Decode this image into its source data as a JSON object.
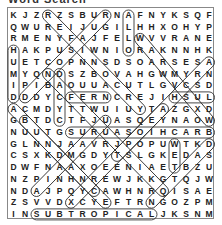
{
  "title": "Word Search",
  "grid": {
    "rows": 18,
    "cols": 18,
    "letters": [
      "KJZRZSBURNAFNYKSQF",
      "QWUREIJUGILHHXOHYP",
      "RMENYFAJFELWVVRANE",
      "HAKPUSIWNIORAKNNHK",
      "UETCOPNNSDSOARSESA",
      "MYQNDSZBOVAHGWMYRN",
      "IPIBAOUUACUTLGVCSD",
      "DDDYCFERNCREJIHSUL",
      "ACMDYTTWUIUYTAZGXD",
      "GBTDCTFJUASQEYNAOW",
      "NUUTGSURUASOIHCARB",
      "GLNNJAAVRJPOPUWTKD",
      "CSXKDMGDYTSLGKEDAS",
      "DWFNAAXOEENIAETBZU",
      "NZPINHNREWJKKGTQJW",
      "NDAJPQYCAWHNRQISAE",
      "ZSVVDXCYEFTRNGOZPM",
      "INSUBTROPICALJKSNM"
    ]
  },
  "found_words": [
    {
      "word": "HUMID",
      "r1": 3,
      "c1": 0,
      "r2": 7,
      "c2": 0
    },
    {
      "word": "FERN",
      "r1": 7,
      "c1": 5,
      "r2": 7,
      "c2": 8
    },
    {
      "word": "LUSH",
      "r1": 7,
      "c1": 17,
      "r2": 7,
      "c2": 14
    },
    {
      "word": "BRACHIOSAURUS",
      "r1": 10,
      "c1": 17,
      "r2": 10,
      "c2": 5
    },
    {
      "word": "SUBTROPICAL",
      "r1": 17,
      "c1": 2,
      "r2": 17,
      "c2": 12
    },
    {
      "word": "CYCAD",
      "r1": 9,
      "c1": 4,
      "r2": 5,
      "c2": 4
    },
    {
      "word": "WET",
      "r1": 11,
      "c1": 14,
      "r2": 13,
      "c2": 14
    },
    {
      "word": "ALLOSAURUS",
      "r1": 0,
      "c1": 10,
      "r2": 3,
      "c2": 10
    },
    {
      "word": "DIAG1",
      "r1": 0,
      "c1": 3,
      "r2": 8,
      "c2": 11
    },
    {
      "word": "DIAG2",
      "r1": 0,
      "c1": 8,
      "r2": 7,
      "c2": 1
    },
    {
      "word": "DIAG3",
      "r1": 2,
      "c1": 11,
      "r2": 9,
      "c2": 17
    },
    {
      "word": "DIAG4",
      "r1": 4,
      "c1": 17,
      "r2": 12,
      "c2": 9
    },
    {
      "word": "DIAG5",
      "r1": 8,
      "c1": 0,
      "r2": 16,
      "c2": 8
    },
    {
      "word": "DIAG6",
      "r1": 9,
      "c1": 1,
      "r2": 15,
      "c2": 7
    },
    {
      "word": "DIAG7",
      "r1": 5,
      "c1": 3,
      "r2": 15,
      "c2": 13
    },
    {
      "word": "DIAG8",
      "r1": 15,
      "c1": 2,
      "r2": 9,
      "c2": 8
    },
    {
      "word": "DIAG9",
      "r1": 16,
      "c1": 5,
      "r2": 8,
      "c2": 13
    },
    {
      "word": "DIAG10",
      "r1": 11,
      "c1": 17,
      "r2": 16,
      "c2": 12
    }
  ],
  "colors": {
    "ink": "#222222",
    "mark": "#333333",
    "border": "#888888"
  }
}
